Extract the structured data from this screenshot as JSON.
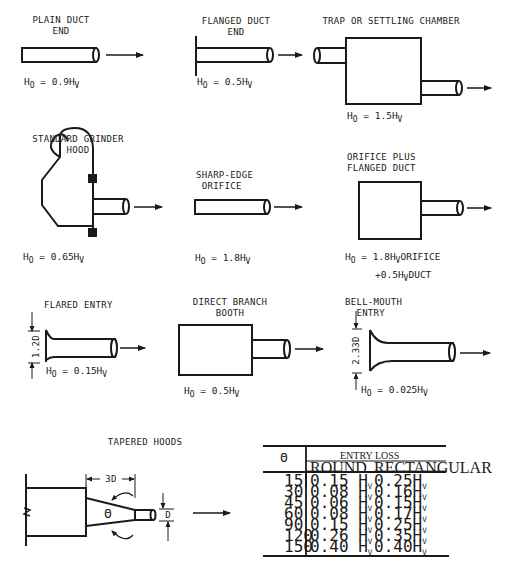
{
  "figures": [
    {
      "id": "plain-duct-end",
      "title_line1": "PLAIN DUCT",
      "title_line2": "END",
      "eq_prefix": "H",
      "eq_sub_o": "O",
      "eq_mid": " = 0.9H",
      "eq_sub_v": "V",
      "eq_suffix": ""
    },
    {
      "id": "flanged-duct-end",
      "title_line1": "FLANGED DUCT",
      "title_line2": "END",
      "eq_prefix": "H",
      "eq_sub_o": "O",
      "eq_mid": " = 0.5H",
      "eq_sub_v": "V",
      "eq_suffix": ""
    },
    {
      "id": "trap-or-settling-chamber",
      "title_line1": "TRAP OR SETTLING CHAMBER",
      "title_line2": "",
      "eq_prefix": "H",
      "eq_sub_o": "O",
      "eq_mid": " = 1.5H",
      "eq_sub_v": "V",
      "eq_suffix": ""
    },
    {
      "id": "standard-grinder-hood",
      "title_line1": "STANDARD GRINDER",
      "title_line2": "HOOD",
      "eq_prefix": "H",
      "eq_sub_o": "O",
      "eq_mid": "  = 0.65H",
      "eq_sub_v": "V",
      "eq_suffix": ""
    },
    {
      "id": "sharp-edge-orifice",
      "title_line1": "SHARP-EDGE",
      "title_line2": "ORIFICE",
      "eq_prefix": "H",
      "eq_sub_o": "O",
      "eq_mid": " = 1.8H",
      "eq_sub_v": "V",
      "eq_suffix": ""
    },
    {
      "id": "orifice-plus-flanged-duct",
      "title_line1": "ORIFICE PLUS",
      "title_line2": "FLANGED DUCT",
      "eq_prefix": "H",
      "eq_sub_o": "O",
      "eq_mid": " = 1.8H",
      "eq_sub_v": "V",
      "eq_suffix": "ORIFICE",
      "eq2_prefix": "+0.5H",
      "eq2_sub_v": "V",
      "eq2_suffix": "DUCT"
    },
    {
      "id": "flared-entry",
      "title_line1": "FLARED ENTRY",
      "title_line2": "",
      "dimension": "1.2D",
      "eq_prefix": "H",
      "eq_sub_o": "O",
      "eq_mid": " = 0.15H",
      "eq_sub_v": "V",
      "eq_suffix": ""
    },
    {
      "id": "direct-branch-booth",
      "title_line1": "DIRECT BRANCH",
      "title_line2": "BOOTH",
      "eq_prefix": "H",
      "eq_sub_o": "O",
      "eq_mid": " = 0.5H",
      "eq_sub_v": "V",
      "eq_suffix": ""
    },
    {
      "id": "bell-mouth-entry",
      "title_line1": "BELL-MOUTH",
      "title_line2": "ENTRY",
      "dimension": "2.33D",
      "eq_prefix": "H",
      "eq_sub_o": "O",
      "eq_mid": " = 0.025H",
      "eq_sub_v": "V",
      "eq_suffix": ""
    },
    {
      "id": "tapered-hoods",
      "title_line1": "TAPERED HOODS",
      "title_line2": "",
      "dimension_length": "3D",
      "dimension_diameter": "D",
      "angle_symbol": "Θ"
    }
  ],
  "table": {
    "angle_header": "Θ",
    "group_header": "ENTRY LOSS",
    "col_round": "ROUND",
    "col_rect": "RECTANGULAR",
    "unit": "H",
    "unit_sub": "V",
    "rows": [
      {
        "angle": "15",
        "round": "0.15 H",
        "rect": "0.25H"
      },
      {
        "angle": "30",
        "round": "0.08 H",
        "rect": "0.16H"
      },
      {
        "angle": "45",
        "round": "0.06 H",
        "rect": "0.15H"
      },
      {
        "angle": "60",
        "round": "0.08 H",
        "rect": "0.17H"
      },
      {
        "angle": "90",
        "round": "0.15 H",
        "rect": "0.25H"
      },
      {
        "angle": "120",
        "round": "0.26 H",
        "rect": "0.35H"
      },
      {
        "angle": "150",
        "round": "0.40 H",
        "rect": "0.40H"
      }
    ]
  },
  "colors": {
    "ink": "#1a1a1a",
    "background": "#ffffff"
  }
}
